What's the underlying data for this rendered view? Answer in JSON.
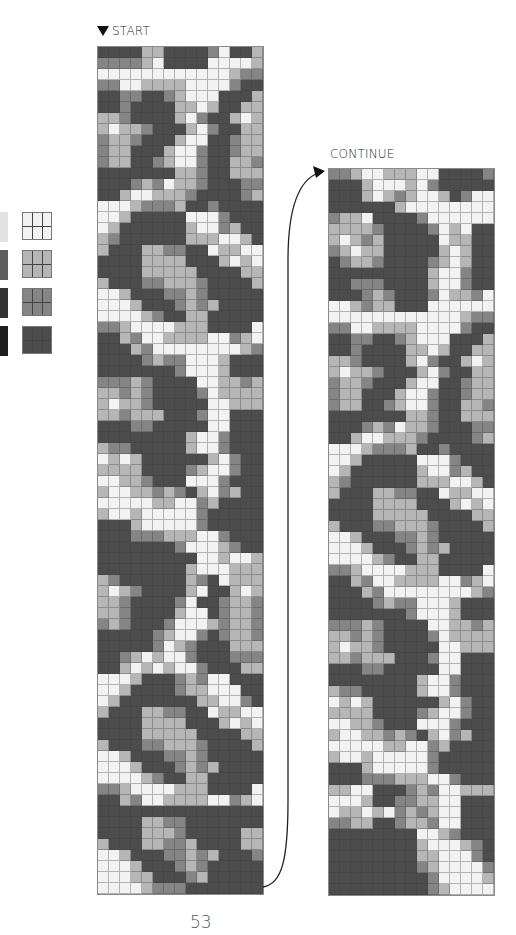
{
  "labels": {
    "start": "START",
    "continue": "CONTINUE",
    "page_number": "53"
  },
  "colors": {
    "0": "#f2f2f2",
    "1": "#b6b6b6",
    "2": "#858585",
    "3": "#4c4c4c"
  },
  "legend": [
    {
      "name": "white",
      "color": "#f2f2f2",
      "texture": "#e0e0e0"
    },
    {
      "name": "light-gray",
      "color": "#b6b6b6",
      "texture": "#6a6a6a"
    },
    {
      "name": "mid-gray",
      "color": "#858585",
      "texture": "#3a3a3a"
    },
    {
      "name": "dark-gray",
      "color": "#4c4c4c",
      "texture": "#222222"
    }
  ],
  "chart": {
    "columns": 15,
    "left_rows": [
      "333311333320331",
      "222210333300001",
      "000000000000122",
      "220011110000233",
      "332233210003331",
      "332333311013311",
      "112333310233101",
      "101123331023311",
      "211233310033211",
      "211333100233211",
      "211332100233112",
      "333333311233111",
      "333212011233322",
      "331001112333321",
      "000122213323333",
      "001333330002333",
      "013333331002133",
      "123333331110013",
      "133311223301100",
      "333311113331010",
      "333311111333311",
      "133322111233331",
      "001333221233333",
      "000133321213333",
      "000012331133333",
      "221000011133330",
      "331200111100210",
      "333120000000012",
      "333321220001333",
      "333333320001333",
      "222123333001121",
      "112123333201111",
      "101123333300111",
      "112111333200333",
      "333223333300333",
      "333333331002333",
      "122333331002333",
      "010133333310233",
      "111133332100233",
      "001123330002333",
      "100112123102133",
      "000001100213333",
      "100100000233333",
      "333100000233333",
      "333222111002333",
      "333333320001233",
      "333333333001001",
      "333333331000111",
      "123333331230111",
      "101233331033101",
      "112333320332112",
      "112333310032112",
      "212333200012112",
      "333332100232112",
      "333332012333111",
      "332101002333222",
      "331010100233311",
      "000133321200333",
      "001333321100033",
      "013333333110023",
      "133311223301100",
      "333311113331010",
      "333311111333311",
      "133322111233331",
      "001333221233333",
      "000133321213333",
      "000012331133333",
      "221000011133330",
      "331200111100210",
      "333333333333333",
      "333311223333333",
      "333311123333311",
      "133311221333311",
      "001333221213332",
      "000133321233333",
      "000113332133333",
      "000012223333333"
    ],
    "right_rows": [
      "221001110033332",
      "333100010233333",
      "333101210013200",
      "333333100000000",
      "211033332000000",
      "111123333201033",
      "101213333301133",
      "210113333310133",
      "321123333210133",
      "333333333100233",
      "332223333100233",
      "333212333201120",
      "001211333000000",
      "000000000000122",
      "220011110000233",
      "332233210003331",
      "332333311013311",
      "112333310233101",
      "101123331023311",
      "211233310033211",
      "211333100233211",
      "211332100233112",
      "333333311233111",
      "333212011233322",
      "331001112333321",
      "000122213323333",
      "001333330002333",
      "013333331002133",
      "123333331110013",
      "133311223301100",
      "333311113331010",
      "333311111333311",
      "133322111233331",
      "001333221233333",
      "000133321213333",
      "000012331133333",
      "221000011133330",
      "331200111100210",
      "333120000000012",
      "333321220001333",
      "333333320001333",
      "222123333001121",
      "112123333201111",
      "101123333300111",
      "112111333200333",
      "333223333300333",
      "333333331002333",
      "122333331002333",
      "010133333310233",
      "111133332100233",
      "001123330002333",
      "100112123102133",
      "000001100213333",
      "100100000233333",
      "333100000233333",
      "333222111002333",
      "110033321200111",
      "000133221100333",
      "011010212100333",
      "221133211200333",
      "333333330012333",
      "333333331000123",
      "333333331100023",
      "333333332100002",
      "333333333200001",
      "333333333210000"
    ]
  }
}
